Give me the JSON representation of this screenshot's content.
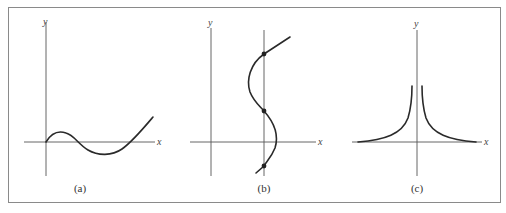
{
  "figure": {
    "panels": [
      {
        "id": "a",
        "caption": "(a)",
        "x_label": "x",
        "y_label": "y",
        "description": "smooth curve starting at origin, rising to a small hump, dipping below x-axis, then rising"
      },
      {
        "id": "b",
        "caption": "(b)",
        "x_label": "x",
        "y_label": "y",
        "description": "S-shaped curve intersecting a vertical line at three marked points"
      },
      {
        "id": "c",
        "caption": "(c)",
        "x_label": "x",
        "y_label": "y",
        "description": "symmetric curve rising steeply toward the y-axis from both sides, approaching the x-axis far away"
      }
    ]
  },
  "colors": {
    "axis": "#555555",
    "curve": "#2a2a2a",
    "frame": "#8a8a8a"
  }
}
